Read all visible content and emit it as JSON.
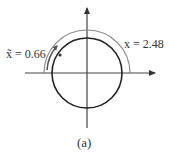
{
  "figure": {
    "caption": "(a)",
    "label_tilde_x": "x̃ = 0.66",
    "label_x": "x = 2.48",
    "colors": {
      "axis": "#444444",
      "circle": "#222222",
      "outer_arc": "#777777",
      "short_arc": "#555555"
    }
  },
  "diagram": {
    "type": "unit circle with angle arcs",
    "elements": [
      {
        "id": "x-axis",
        "kind": "arrow"
      },
      {
        "id": "y-axis",
        "kind": "arrow"
      },
      {
        "id": "circle",
        "kind": "circle"
      },
      {
        "id": "arc-x",
        "kind": "arc-arrow",
        "label": "x = 2.48"
      },
      {
        "id": "arc-tilde-x",
        "kind": "arc-arrow",
        "label": "x̃ = 0.66"
      },
      {
        "id": "point",
        "kind": "point-on-circle"
      }
    ]
  }
}
